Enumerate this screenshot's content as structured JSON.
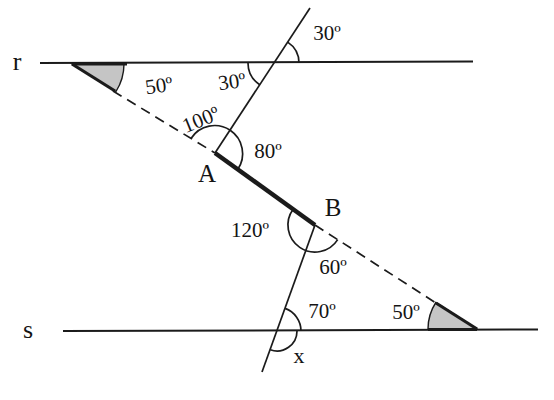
{
  "figure": {
    "labels": {
      "line_r": "r",
      "line_s": "s",
      "point_a": "A",
      "point_b": "B",
      "angle_top_exterior": "30º",
      "angle_top_interior": "30º",
      "angle_wedge_r": "50º",
      "angle_a_upper": "100º",
      "angle_a_lower": "80º",
      "angle_b_left": "120º",
      "angle_b_right": "60º",
      "angle_s_upper": "70º",
      "angle_wedge_s": "50º",
      "angle_unknown": "x"
    },
    "angles": [
      {
        "at": "intersection of upper transversal with line r",
        "side": "above r, right of transversal",
        "value": "30º"
      },
      {
        "at": "intersection of upper transversal with line r",
        "side": "below r, left of transversal",
        "value": "30º"
      },
      {
        "at": "left end of dashed line on line r",
        "side": "shaded wedge between r and dashed line",
        "value": "50º"
      },
      {
        "at": "point A",
        "side": "between dashed line and upper transversal",
        "value": "100º"
      },
      {
        "at": "point A",
        "side": "between upper transversal and segment AB",
        "value": "80º"
      },
      {
        "at": "point B",
        "side": "between segment AB and lower transversal",
        "value": "120º"
      },
      {
        "at": "point B",
        "side": "between lower transversal and dashed line",
        "value": "60º"
      },
      {
        "at": "intersection of lower transversal with line s",
        "side": "above s, right of transversal",
        "value": "70º"
      },
      {
        "at": "right end of dashed line on line s",
        "side": "shaded wedge between dashed line and s",
        "value": "50º"
      },
      {
        "at": "intersection of lower transversal with line s",
        "side": "below s, right of transversal",
        "value": "x"
      }
    ],
    "colors": {
      "line": "#1b1b1b",
      "wedge_fill": "#c5c5c5",
      "background": "#ffffff"
    }
  }
}
